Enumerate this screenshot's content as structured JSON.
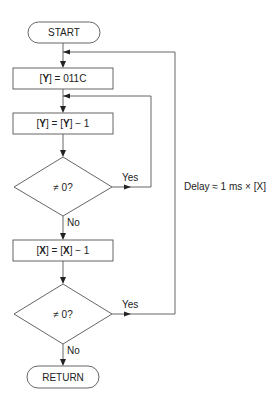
{
  "diagram": {
    "type": "flowchart",
    "nodes": {
      "start": {
        "label": "START",
        "shape": "terminal"
      },
      "set_y": {
        "label_prefix": "[",
        "reg": "Y",
        "label_suffix": "] = 011C",
        "shape": "process"
      },
      "dec_y": {
        "p1": "[",
        "r1": "Y",
        "p2": "] = [",
        "r2": "Y",
        "p3": "] − 1",
        "shape": "process"
      },
      "check_y": {
        "label": "≠ 0?",
        "shape": "decision"
      },
      "dec_x": {
        "p1": "[",
        "r1": "X",
        "p2": "] = [",
        "r2": "X",
        "p3": "] − 1",
        "shape": "process"
      },
      "check_x": {
        "label": "≠ 0?",
        "shape": "decision"
      },
      "return": {
        "label": "RETURN",
        "shape": "terminal"
      }
    },
    "edge_labels": {
      "check_y_yes": "Yes",
      "check_y_no": "No",
      "check_x_yes": "Yes",
      "check_x_no": "No"
    },
    "annotation": "Delay ≈ 1 ms × [X]"
  }
}
